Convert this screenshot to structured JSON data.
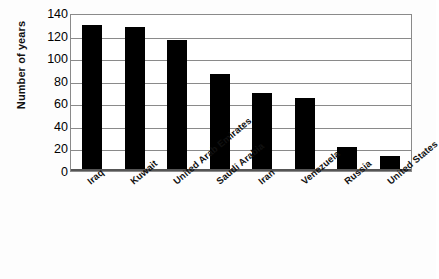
{
  "chart_data": {
    "type": "bar",
    "title": "",
    "subtitle": "",
    "xlabel": "",
    "ylabel": "Number of years",
    "categories": [
      "Iraq",
      "Kuwait",
      "United Arab Emirates",
      "Saudi Arabia",
      "Iran",
      "Venezuela",
      "Russia",
      "United States"
    ],
    "values": [
      129,
      128,
      116,
      86,
      69,
      65,
      21,
      13
    ],
    "ylim": [
      0,
      140
    ],
    "yticks": [
      0,
      20,
      40,
      60,
      80,
      100,
      120,
      140
    ],
    "ytick_labels": [
      "0",
      "20",
      "40",
      "60",
      "80",
      "100",
      "120",
      "140"
    ],
    "grid": true,
    "grid_axis": "y",
    "legend": false,
    "legend_position": "none",
    "bar_color": "#000000",
    "gridline_color": "#8a8a8a",
    "axis_color": "#555555",
    "background_color": "#ffffff"
  }
}
